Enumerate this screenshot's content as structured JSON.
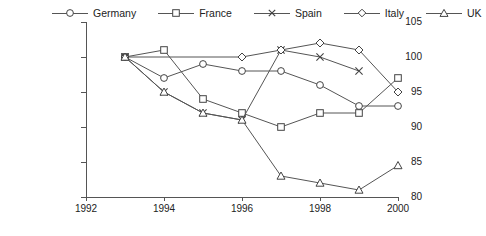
{
  "chart_data": {
    "type": "line",
    "title": "",
    "subtitle": "",
    "xlabel": "",
    "ylabel": "",
    "x": [
      1993,
      1994,
      1995,
      1996,
      1997,
      1998,
      1999,
      2000
    ],
    "xlim": [
      1992,
      2000
    ],
    "ylim": [
      80,
      105
    ],
    "x_ticks": [
      1992,
      1994,
      1996,
      1998,
      2000
    ],
    "x_tick_labels": [
      "1992",
      "1994",
      "1996",
      "1998",
      "2000"
    ],
    "x_minor_ticks": [
      1993,
      1995,
      1997,
      1999
    ],
    "y_ticks": [
      80,
      85,
      90,
      95,
      100,
      105
    ],
    "y_tick_labels": [
      "80",
      "85",
      "90",
      "95",
      "100",
      "105"
    ],
    "grid": false,
    "legend_position": "top",
    "series": [
      {
        "name": "Germany",
        "marker": "circle",
        "x": [
          1993,
          1994,
          1995,
          1996,
          1997,
          1998,
          1999,
          2000
        ],
        "values": [
          100,
          97,
          99,
          98,
          98,
          96,
          93,
          93
        ]
      },
      {
        "name": "France",
        "marker": "square",
        "x": [
          1993,
          1994,
          1995,
          1996,
          1997,
          1998,
          1999,
          2000
        ],
        "values": [
          100,
          101,
          94,
          92,
          90,
          92,
          92,
          97
        ]
      },
      {
        "name": "Spain",
        "marker": "x",
        "x": [
          1993,
          1994,
          1995,
          1996,
          1997,
          1998,
          1999
        ],
        "values": [
          100,
          95,
          92,
          91,
          101,
          100,
          98
        ]
      },
      {
        "name": "Italy",
        "marker": "diamond",
        "x": [
          1993,
          1996,
          1997,
          1998,
          1999,
          2000
        ],
        "values": [
          100,
          100,
          101,
          102,
          101,
          95
        ]
      },
      {
        "name": "UK",
        "marker": "triangle",
        "x": [
          1993,
          1994,
          1995,
          1996,
          1997,
          1998,
          1999,
          2000
        ],
        "values": [
          100,
          95,
          92,
          91,
          83,
          82,
          81,
          84.5
        ]
      }
    ]
  },
  "legend": {
    "items": [
      {
        "label": "Germany",
        "marker": "circle"
      },
      {
        "label": "France",
        "marker": "square"
      },
      {
        "label": "Spain",
        "marker": "x"
      },
      {
        "label": "Italy",
        "marker": "diamond"
      },
      {
        "label": "UK",
        "marker": "triangle"
      }
    ]
  },
  "axes": {
    "y_labels": [
      "105",
      "100",
      "95",
      "90",
      "85",
      "80"
    ],
    "x_labels": [
      "1992",
      "1994",
      "1996",
      "1998",
      "2000"
    ]
  }
}
